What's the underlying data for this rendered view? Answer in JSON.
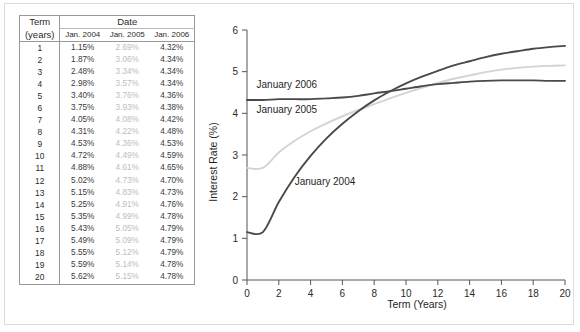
{
  "table": {
    "header": {
      "term_line1": "Term",
      "term_line2": "(years)",
      "date": "Date",
      "col_2004": "Jan. 2004",
      "col_2005": "Jan. 2005",
      "col_2006": "Jan. 2006"
    },
    "rows": [
      {
        "term": "1",
        "y2004": "1.15%",
        "y2005": "2.69%",
        "y2006": "4.32%"
      },
      {
        "term": "2",
        "y2004": "1.87%",
        "y2005": "3.06%",
        "y2006": "4.34%"
      },
      {
        "term": "3",
        "y2004": "2.48%",
        "y2005": "3.34%",
        "y2006": "4.34%"
      },
      {
        "term": "4",
        "y2004": "2.98%",
        "y2005": "3.57%",
        "y2006": "4.34%"
      },
      {
        "term": "5",
        "y2004": "3.40%",
        "y2005": "3.76%",
        "y2006": "4.36%"
      },
      {
        "term": "6",
        "y2004": "3.75%",
        "y2005": "3.93%",
        "y2006": "4.38%"
      },
      {
        "term": "7",
        "y2004": "4.05%",
        "y2005": "4.08%",
        "y2006": "4.42%"
      },
      {
        "term": "8",
        "y2004": "4.31%",
        "y2005": "4.22%",
        "y2006": "4.48%"
      },
      {
        "term": "9",
        "y2004": "4.53%",
        "y2005": "4.36%",
        "y2006": "4.53%"
      },
      {
        "term": "10",
        "y2004": "4.72%",
        "y2005": "4.49%",
        "y2006": "4.59%"
      },
      {
        "term": "11",
        "y2004": "4.88%",
        "y2005": "4.61%",
        "y2006": "4.65%"
      },
      {
        "term": "12",
        "y2004": "5.02%",
        "y2005": "4.73%",
        "y2006": "4.70%"
      },
      {
        "term": "13",
        "y2004": "5.15%",
        "y2005": "4.83%",
        "y2006": "4.73%"
      },
      {
        "term": "14",
        "y2004": "5.25%",
        "y2005": "4.91%",
        "y2006": "4.76%"
      },
      {
        "term": "15",
        "y2004": "5.35%",
        "y2005": "4.99%",
        "y2006": "4.78%"
      },
      {
        "term": "16",
        "y2004": "5.43%",
        "y2005": "5.05%",
        "y2006": "4.79%"
      },
      {
        "term": "17",
        "y2004": "5.49%",
        "y2005": "5.09%",
        "y2006": "4.79%"
      },
      {
        "term": "18",
        "y2004": "5.55%",
        "y2005": "5.12%",
        "y2006": "4.79%"
      },
      {
        "term": "19",
        "y2004": "5.59%",
        "y2005": "5.14%",
        "y2006": "4.78%"
      },
      {
        "term": "20",
        "y2004": "5.62%",
        "y2005": "5.15%",
        "y2006": "4.78%"
      }
    ]
  },
  "chart_data": {
    "type": "line",
    "title": "",
    "xlabel": "Term (Years)",
    "ylabel": "Interest Rate (%)",
    "xlim": [
      0,
      20
    ],
    "ylim": [
      0,
      6
    ],
    "xticks": [
      0,
      2,
      4,
      6,
      8,
      10,
      12,
      14,
      16,
      18,
      20
    ],
    "xtick_labels": [
      "0",
      "2",
      "4",
      "6",
      "8",
      "10",
      "12",
      "14",
      "16",
      "18",
      "20"
    ],
    "yticks": [
      0,
      1,
      2,
      3,
      4,
      5,
      6
    ],
    "ytick_labels": [
      "0",
      "1",
      "2",
      "3",
      "4",
      "5",
      "6"
    ],
    "grid": false,
    "legend_position": "inline-annotations",
    "x": [
      0,
      1,
      2,
      3,
      4,
      5,
      6,
      7,
      8,
      9,
      10,
      11,
      12,
      13,
      14,
      15,
      16,
      17,
      18,
      19,
      20
    ],
    "series": [
      {
        "name": "January 2004",
        "color": "#4a4a4a",
        "label_x": 3.0,
        "label_y": 2.28,
        "values": [
          1.15,
          1.15,
          1.87,
          2.48,
          2.98,
          3.4,
          3.75,
          4.05,
          4.31,
          4.53,
          4.72,
          4.88,
          5.02,
          5.15,
          5.25,
          5.35,
          5.43,
          5.49,
          5.55,
          5.59,
          5.62
        ]
      },
      {
        "name": "January 2005",
        "color": "#d4d4d4",
        "label_x": 0.6,
        "label_y": 4.0,
        "values": [
          2.69,
          2.69,
          3.06,
          3.34,
          3.57,
          3.76,
          3.93,
          4.08,
          4.22,
          4.36,
          4.49,
          4.61,
          4.73,
          4.83,
          4.91,
          4.99,
          5.05,
          5.09,
          5.12,
          5.14,
          5.15
        ]
      },
      {
        "name": "January 2006",
        "color": "#4a4a4a",
        "label_x": 0.6,
        "label_y": 4.62,
        "values": [
          4.32,
          4.32,
          4.34,
          4.34,
          4.34,
          4.36,
          4.38,
          4.42,
          4.48,
          4.53,
          4.59,
          4.65,
          4.7,
          4.73,
          4.76,
          4.78,
          4.79,
          4.79,
          4.79,
          4.78,
          4.78
        ]
      }
    ],
    "axis_color": "#555555"
  }
}
